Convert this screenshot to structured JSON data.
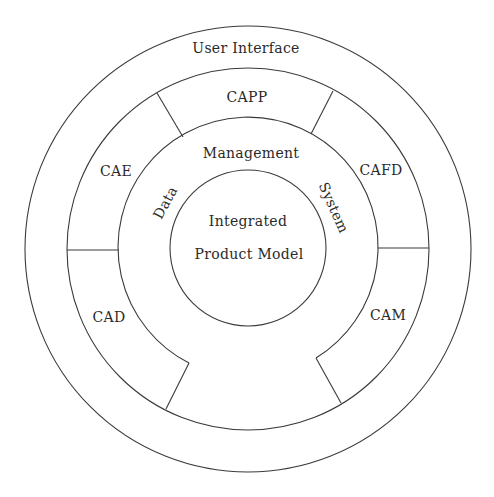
{
  "diagram": {
    "type": "concentric-ring architecture",
    "colors": {
      "stroke": "#3a3a3a",
      "text": "#2a2a2a",
      "background": "#ffffff"
    },
    "outer_ring": {
      "label": "User Interface"
    },
    "application_ring": {
      "segments": [
        {
          "id": "capp",
          "label": "CAPP"
        },
        {
          "id": "cae",
          "label": "CAE"
        },
        {
          "id": "cafd",
          "label": "CAFD"
        },
        {
          "id": "cad",
          "label": "CAD"
        },
        {
          "id": "cam",
          "label": "CAM"
        }
      ]
    },
    "data_ring": {
      "label_left": "Data",
      "label_top": "Management",
      "label_right": "System"
    },
    "core": {
      "line1": "Integrated",
      "line2": "Product Model"
    }
  }
}
